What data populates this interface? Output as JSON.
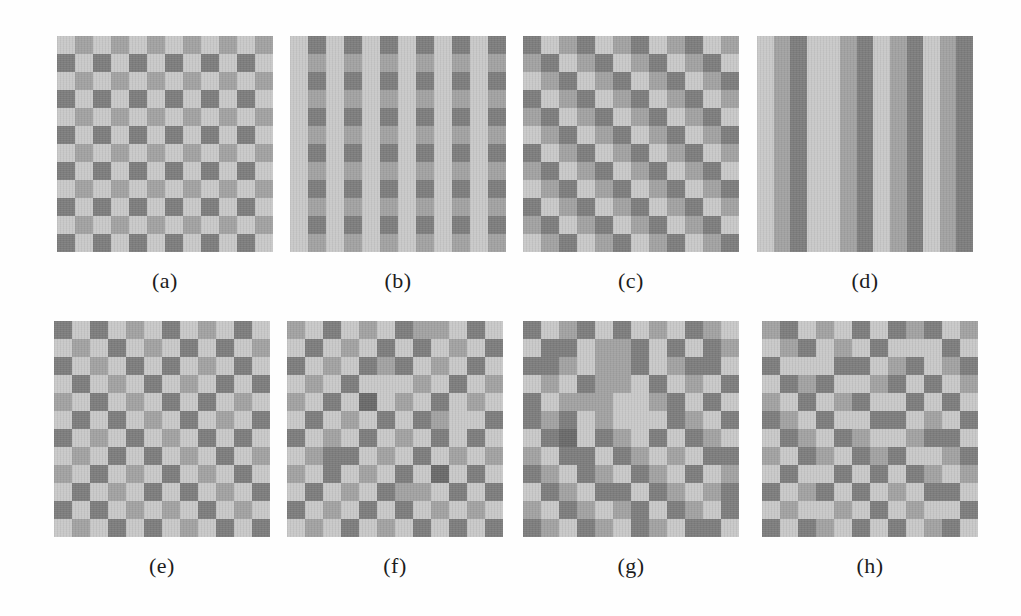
{
  "figure": {
    "colors": {
      "0": "#c8c8c8",
      "1": "#a2a2a2",
      "2": "#7d7d7d",
      "3": "#6a6a6a"
    },
    "panels": [
      {
        "id": "a",
        "label": "(a)",
        "pattern": "checkerboard-two-tone",
        "grid": [
          "010101010101",
          "202020202020",
          "010101010101",
          "202020202020",
          "010101010101",
          "202020202020",
          "010101010101",
          "202020202020",
          "010101010101",
          "202020202020",
          "010101010101",
          "202020202020"
        ]
      },
      {
        "id": "b",
        "label": "(b)",
        "pattern": "vertical-checkered-stripes",
        "grid": [
          "020202020202",
          "010101010101",
          "020202020202",
          "010101010101",
          "020202020202",
          "010101010101",
          "020202020202",
          "010101010101",
          "020202020202",
          "010101010101",
          "020202020202",
          "010101010101"
        ]
      },
      {
        "id": "c",
        "label": "(c)",
        "pattern": "diagonal-three-level",
        "grid": [
          "201201201201",
          "120120120120",
          "012012012012",
          "201201201201",
          "120120120120",
          "012012012012",
          "201201201201",
          "120120120120",
          "012012012012",
          "201201201201",
          "120120120120",
          "012012012012"
        ]
      },
      {
        "id": "d",
        "label": "(d)",
        "pattern": "vertical-stripes-three-level",
        "grid": [
          "0120012012012",
          "0120012012012",
          "0120012012012",
          "0120012012012",
          "0120012012012",
          "0120012012012",
          "0120012012012",
          "0120012012012",
          "0120012012012",
          "0120012012012",
          "0120012012012",
          "0120012012012"
        ]
      },
      {
        "id": "e",
        "label": "(e)",
        "pattern": "checkerboard-random-dark-shades",
        "grid": [
          "202010201020",
          "010201020201",
          "201020201020",
          "020102010202",
          "102010202010",
          "020201020102",
          "201020102020",
          "010202010201",
          "102010201020",
          "020102020102",
          "202010102010",
          "010202010202"
        ]
      },
      {
        "id": "f",
        "label": "(f)",
        "pattern": "noisy-checkerboard",
        "grid": [
          "102010211020",
          "020102020102",
          "201021201020",
          "010200010201",
          "102030102010",
          "020102021002",
          "201020102020",
          "012201020101",
          "102010203020",
          "020102110202",
          "201020201010",
          "010201020202"
        ]
      },
      {
        "id": "g",
        "label": "(g)",
        "pattern": "random-blocky-texture",
        "grid": [
          "201202010210",
          "022011202021",
          "221011201220",
          "010211020102",
          "201110012020",
          "212010002102",
          "023021020210",
          "102202101022",
          "210210210201",
          "021022021012",
          "102101202102",
          "210210210220"
        ]
      },
      {
        "id": "h",
        "label": "(h)",
        "pattern": "random-light-dominant",
        "grid": [
          "120102021201",
          "012010200020",
          "200022012012",
          "021200120201",
          "102012002020",
          "210200220102",
          "021021001220",
          "102102120012",
          "020020202101",
          "201202010220",
          "010010201002",
          "202102020120"
        ]
      }
    ]
  }
}
